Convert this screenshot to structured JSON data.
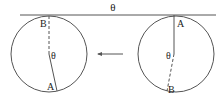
{
  "diagram": {
    "top_label": "θ",
    "left_circle": {
      "label_top": "B",
      "label_bottom": "A",
      "angle_label": "θ"
    },
    "right_circle": {
      "label_top": "A",
      "label_bottom": "B",
      "angle_label": "θ"
    },
    "arrow_direction": "left",
    "colors": {
      "stroke": "#444444",
      "text": "#222222"
    }
  }
}
